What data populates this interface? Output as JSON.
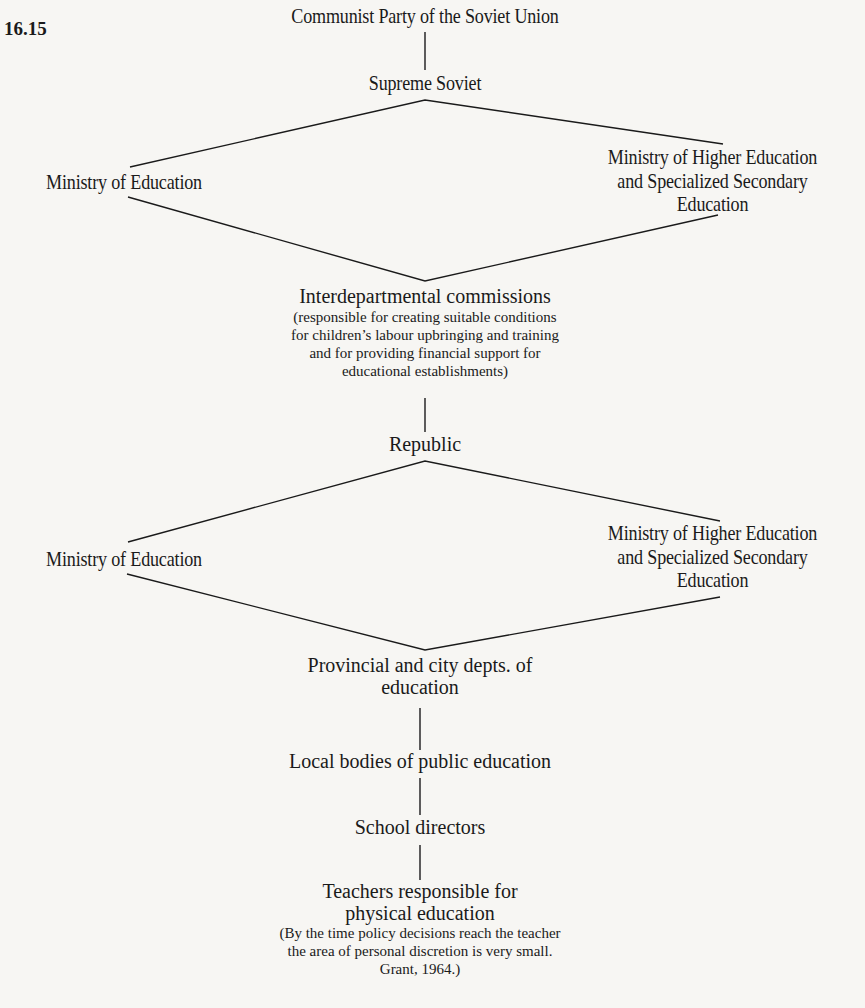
{
  "figure": {
    "number": "16.15"
  },
  "diagram": {
    "nodes": {
      "party": "Communist Party of the Soviet Union",
      "supreme_soviet": "Supreme Soviet",
      "union_ministry_education": "Ministry of Education",
      "union_ministry_higher": {
        "line1": "Ministry of Higher Education",
        "line2": "and Specialized Secondary",
        "line3": "Education"
      },
      "interdepartmental": {
        "title": "Interdepartmental commissions",
        "note_line1": "(responsible for creating suitable conditions",
        "note_line2": "for children’s labour upbringing and training",
        "note_line3": "and for providing financial support for",
        "note_line4": "educational establishments)"
      },
      "republic": "Republic",
      "republic_ministry_education": "Ministry of Education",
      "republic_ministry_higher": {
        "line1": "Ministry of Higher Education",
        "line2": "and Specialized Secondary",
        "line3": "Education"
      },
      "provincial": {
        "line1": "Provincial and city depts. of",
        "line2": "education"
      },
      "local_bodies": "Local bodies of public education",
      "school_directors": "School directors",
      "teachers": {
        "line1": "Teachers responsible for",
        "line2": "physical education",
        "note_line1": "(By the time policy decisions reach the teacher",
        "note_line2": "the area of personal discretion is very small.",
        "note_line3": "Grant, 1964.)"
      }
    },
    "edges": [
      [
        "party",
        "supreme_soviet"
      ],
      [
        "supreme_soviet",
        "union_ministry_education"
      ],
      [
        "supreme_soviet",
        "union_ministry_higher"
      ],
      [
        "union_ministry_education",
        "interdepartmental"
      ],
      [
        "union_ministry_higher",
        "interdepartmental"
      ],
      [
        "interdepartmental",
        "republic"
      ],
      [
        "republic",
        "republic_ministry_education"
      ],
      [
        "republic",
        "republic_ministry_higher"
      ],
      [
        "republic_ministry_education",
        "provincial"
      ],
      [
        "republic_ministry_higher",
        "provincial"
      ],
      [
        "provincial",
        "local_bodies"
      ],
      [
        "local_bodies",
        "school_directors"
      ],
      [
        "school_directors",
        "teachers"
      ]
    ]
  }
}
